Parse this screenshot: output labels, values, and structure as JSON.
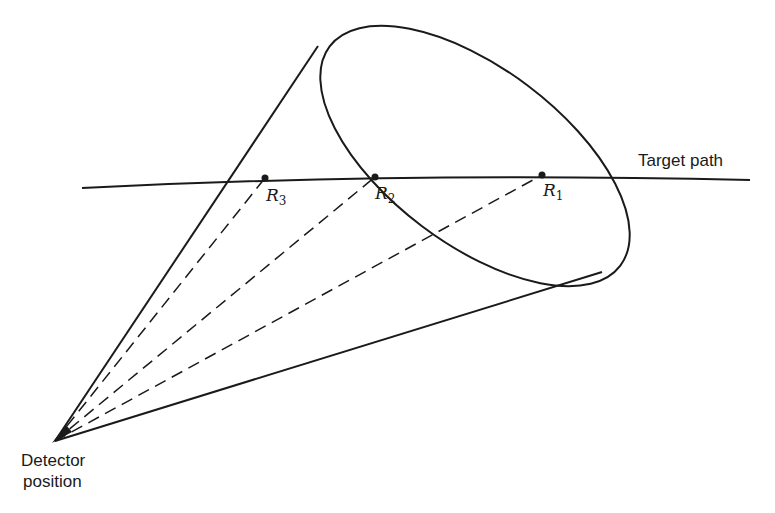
{
  "diagram": {
    "title": "",
    "labels": {
      "target_path": "Target path",
      "detector_line1": "Detector",
      "detector_line2": "position"
    },
    "points": [
      {
        "id": "R1",
        "letter": "R",
        "subscript": "1"
      },
      {
        "id": "R2",
        "letter": "R",
        "subscript": "2"
      },
      {
        "id": "R3",
        "letter": "R",
        "subscript": "3"
      }
    ],
    "stroke_color": "#1a1a1a"
  }
}
